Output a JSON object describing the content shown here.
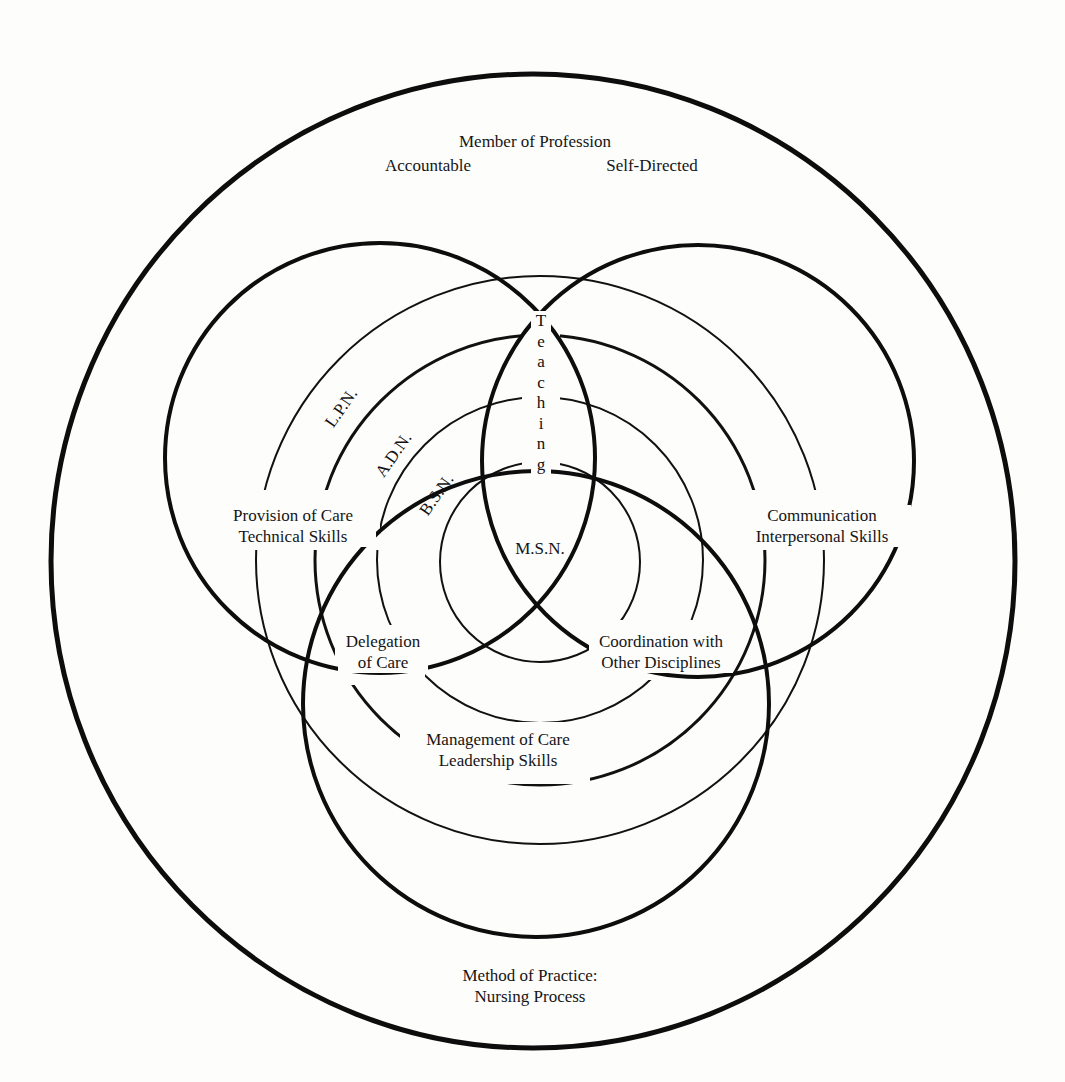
{
  "figure": {
    "outer_circle": {
      "top_label": "Member of Profession",
      "top_left_label": "Accountable",
      "top_right_label": "Self-Directed",
      "bottom_label_line1": "Method of Practice:",
      "bottom_label_line2": "Nursing Process"
    },
    "role_circles": {
      "left": {
        "line1": "Provision of Care",
        "line2": "Technical Skills"
      },
      "right": {
        "line1": "Communication",
        "line2": "Interpersonal Skills"
      },
      "bottom": {
        "line1": "Management of Care",
        "line2": "Leadership Skills"
      }
    },
    "overlap_labels": {
      "left_bottom": {
        "line1": "Delegation",
        "line2": "of Care"
      },
      "right_bottom": {
        "line1": "Coordination with",
        "line2": "Other Disciplines"
      },
      "center": "M.S.N."
    },
    "education_levels": [
      "L.P.N.",
      "A.D.N.",
      "B.S.N.",
      "M.S.N."
    ],
    "vertical_label": "Teaching",
    "vertical_letters": [
      "T",
      "e",
      "a",
      "c",
      "h",
      "i",
      "n",
      "g"
    ]
  }
}
